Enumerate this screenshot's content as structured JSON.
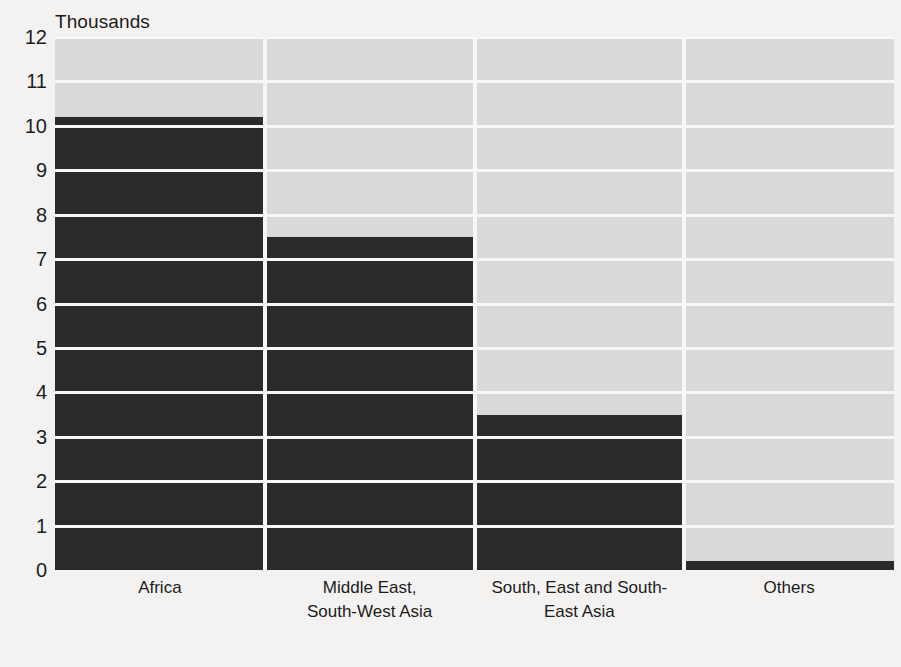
{
  "chart_data": {
    "type": "bar",
    "title": "",
    "subtitle": "",
    "unit_caption": "Thousands",
    "xlabel": "",
    "ylabel": "Thousands",
    "ylim": [
      0,
      12
    ],
    "grid": true,
    "legend": "none",
    "categories": [
      "Africa",
      "Middle East, South-West Asia",
      "South, East and South-East Asia",
      "Others"
    ],
    "category_label_lines": [
      [
        "Africa"
      ],
      [
        "Middle East,",
        "South-West Asia"
      ],
      [
        "South, East and South-",
        "East Asia"
      ],
      [
        "Others"
      ]
    ],
    "values": [
      10.2,
      7.5,
      3.5,
      0.2
    ],
    "y_ticks": [
      12,
      11,
      10,
      9,
      8,
      7,
      6,
      5,
      4,
      3,
      2,
      1,
      0
    ],
    "series": [
      {
        "name": "Value",
        "values": [
          10.2,
          7.5,
          3.5,
          0.2
        ]
      }
    ],
    "colors": {
      "bar": "#2b2b2b",
      "plot_background": "#d9d9d9",
      "gridline": "#f7f7f5",
      "page_background": "#f3f2f0",
      "text": "#1c1c1c"
    }
  }
}
